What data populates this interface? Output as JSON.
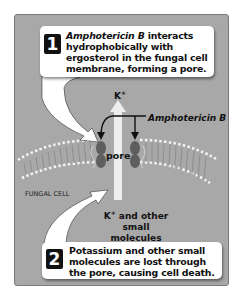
{
  "callouts": [
    {
      "number": "1",
      "italic_lead": "Amphotericin B",
      "lines": [
        " interacts",
        "hydrophobically with",
        "ergosterol in the fungal cell",
        "membrane, forming a pore."
      ]
    },
    {
      "number": "2",
      "lines": [
        "Potassium and other small",
        "molecules are lost through",
        "the pore, causing cell death."
      ]
    }
  ],
  "labels": {
    "k_ion": "K",
    "k_charge": "+",
    "amphotericin": "Amphotericin B",
    "pore": "pore",
    "fungal_cell": "FUNGAL CELL",
    "k_other_1_symbol": "K",
    "k_other_1_charge": "+",
    "k_other_1_rest": " and other",
    "k_other_2": "small molecules"
  },
  "colors": {
    "panel_bg": "#a8a8a8",
    "callout_bg": "#ffffff",
    "number_bg": "#111111",
    "drug_molecule": "#5e5e5e",
    "channel_arrow": "#eeeeee"
  }
}
